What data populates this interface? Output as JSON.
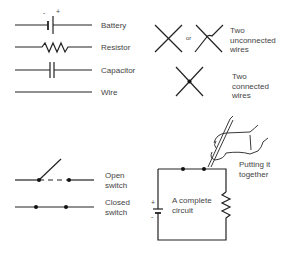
{
  "legend": {
    "battery": "Battery",
    "battery_minus": "-",
    "battery_plus": "+",
    "resistor": "Resistor",
    "capacitor": "Capacitor",
    "wire": "Wire",
    "or": "or",
    "unconnected": "Two\nunconnected\nwires",
    "connected": "Two\nconnected\nwires",
    "open_switch": "Open\nswitch",
    "closed_switch": "Closed\nswitch"
  },
  "circuit": {
    "label": "A complete\ncircuit",
    "plus": "+",
    "minus": "-",
    "caption": "Putting it\ntogether"
  },
  "colors": {
    "line": "#222222",
    "text": "#444444",
    "background": "#ffffff"
  }
}
